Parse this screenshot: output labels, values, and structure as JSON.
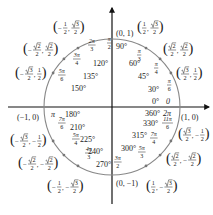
{
  "diagram": {
    "type": "unit-circle",
    "center": [
      112,
      107
    ],
    "radius": 68,
    "colors": {
      "axis": "#111111",
      "circle": "#888888",
      "point": "#777777",
      "text": "#222222"
    },
    "axis_points": [
      {
        "name": "point-1-0",
        "label": "(1, 0)",
        "x": 181,
        "y": 120
      },
      {
        "name": "point-0-1",
        "label": "(0, 1)",
        "x": 116,
        "y": 36
      },
      {
        "name": "point-neg1-0",
        "label": "(−1, 0)",
        "x": 17,
        "y": 120
      },
      {
        "name": "point-0-neg1",
        "label": "(0, −1)",
        "x": 116,
        "y": 186
      }
    ],
    "angles": [
      {
        "deg": "0°",
        "rad": "0",
        "dx": 152,
        "dy": 104,
        "rx": 166,
        "ry": 104
      },
      {
        "deg": "30°",
        "rad_num": "π",
        "rad_den": "6",
        "dx": 148,
        "dy": 92,
        "rx": 167,
        "ry": 87
      },
      {
        "deg": "45°",
        "rad_num": "π",
        "rad_den": "4",
        "dx": 138,
        "dy": 79,
        "rx": 154,
        "ry": 70
      },
      {
        "deg": "60°",
        "rad_num": "π",
        "rad_den": "3",
        "dx": 129,
        "dy": 66,
        "rx": 137,
        "ry": 57
      },
      {
        "deg": "90°",
        "rad_num": "π",
        "rad_den": "2",
        "dx": 116,
        "dy": 49,
        "rx": 107,
        "ry": 45
      },
      {
        "deg": "120°",
        "rad_num": "2π",
        "rad_den": "3",
        "dx": 93,
        "dy": 66,
        "rx": 88,
        "ry": 47
      },
      {
        "deg": "135°",
        "rad_num": "3π",
        "rad_den": "4",
        "dx": 83,
        "dy": 79,
        "rx": 73,
        "ry": 61
      },
      {
        "deg": "150°",
        "rad_num": "5π",
        "rad_den": "6",
        "dx": 71,
        "dy": 91,
        "rx": 58,
        "ry": 77
      },
      {
        "deg": "180°",
        "rad": "π",
        "dx": 65,
        "dy": 117,
        "rx": 51,
        "ry": 117
      },
      {
        "deg": "210°",
        "rad_num": "7π",
        "rad_den": "6",
        "dx": 70,
        "dy": 130,
        "rx": 58,
        "ry": 125
      },
      {
        "deg": "225°",
        "rad_num": "5π",
        "rad_den": "4",
        "dx": 80,
        "dy": 142,
        "rx": 72,
        "ry": 141
      },
      {
        "deg": "240°",
        "rad_num": "4π",
        "rad_den": "3",
        "dx": 88,
        "dy": 154,
        "rx": 85,
        "ry": 155
      },
      {
        "deg": "270°",
        "rad_num": "3π",
        "rad_den": "2",
        "dx": 96,
        "dy": 167,
        "rx": 114,
        "ry": 164
      },
      {
        "deg": "300°",
        "rad_num": "5π",
        "rad_den": "3",
        "dx": 121,
        "dy": 151,
        "rx": 138,
        "ry": 154
      },
      {
        "deg": "315°",
        "rad_num": "7π",
        "rad_den": "4",
        "dx": 132,
        "dy": 138,
        "rx": 150,
        "ry": 140
      },
      {
        "deg": "330°",
        "rad_num": "11π",
        "rad_den": "6",
        "dx": 143,
        "dy": 126,
        "rx": 162,
        "ry": 125
      },
      {
        "deg": "360°",
        "rad": "2π",
        "dx": 145,
        "dy": 116,
        "rx": 163,
        "ry": 116
      }
    ],
    "coords": [
      {
        "x_num": "1",
        "x_den": "2",
        "x_sign": "",
        "x_sqrt": false,
        "y_num": "3",
        "y_den": "2",
        "y_sign": "",
        "y_sqrt": true,
        "px": 137,
        "py": 28
      },
      {
        "x_num": "2",
        "x_den": "2",
        "x_sign": "",
        "x_sqrt": true,
        "y_num": "2",
        "y_den": "2",
        "y_sign": "",
        "y_sqrt": true,
        "px": 163,
        "py": 50
      },
      {
        "x_num": "3",
        "x_den": "2",
        "x_sign": "",
        "x_sqrt": true,
        "y_num": "1",
        "y_den": "2",
        "y_sign": "",
        "y_sqrt": false,
        "px": 176,
        "py": 74
      },
      {
        "x_num": "1",
        "x_den": "2",
        "x_sign": "−",
        "x_sqrt": false,
        "y_num": "3",
        "y_den": "2",
        "y_sign": "",
        "y_sqrt": true,
        "px": 53,
        "py": 28
      },
      {
        "x_num": "2",
        "x_den": "2",
        "x_sign": "−",
        "x_sqrt": true,
        "y_num": "2",
        "y_den": "2",
        "y_sign": "",
        "y_sqrt": true,
        "px": 23,
        "py": 50
      },
      {
        "x_num": "3",
        "x_den": "2",
        "x_sign": "−",
        "x_sqrt": true,
        "y_num": "1",
        "y_den": "2",
        "y_sign": "",
        "y_sqrt": false,
        "px": 15,
        "py": 74
      },
      {
        "x_num": "3",
        "x_den": "2",
        "x_sign": "−",
        "x_sqrt": true,
        "y_num": "1",
        "y_den": "2",
        "y_sign": "−",
        "y_sqrt": false,
        "px": 10,
        "py": 141
      },
      {
        "x_num": "2",
        "x_den": "2",
        "x_sign": "−",
        "x_sqrt": true,
        "y_num": "2",
        "y_den": "2",
        "y_sign": "−",
        "y_sqrt": true,
        "px": 18,
        "py": 164
      },
      {
        "x_num": "1",
        "x_den": "2",
        "x_sign": "−",
        "x_sqrt": false,
        "y_num": "3",
        "y_den": "2",
        "y_sign": "−",
        "y_sqrt": true,
        "px": 47,
        "py": 187
      },
      {
        "x_num": "1",
        "x_den": "2",
        "x_sign": "",
        "x_sqrt": false,
        "y_num": "3",
        "y_den": "2",
        "y_sign": "−",
        "y_sqrt": true,
        "px": 146,
        "py": 187
      },
      {
        "x_num": "2",
        "x_den": "2",
        "x_sign": "",
        "x_sqrt": true,
        "y_num": "2",
        "y_den": "2",
        "y_sign": "−",
        "y_sqrt": true,
        "px": 166,
        "py": 160
      },
      {
        "x_num": "3",
        "x_den": "2",
        "x_sign": "",
        "x_sqrt": true,
        "y_num": "1",
        "y_den": "2",
        "y_sign": "−",
        "y_sqrt": false,
        "px": 178,
        "py": 135
      }
    ]
  }
}
